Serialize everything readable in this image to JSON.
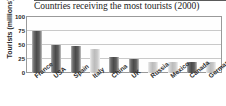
{
  "chart_data": {
    "type": "bar",
    "title": "Countries receiving the most tourists (2000)",
    "xlabel": "",
    "ylabel": "Tourists (millions)",
    "ylim": [
      0,
      100
    ],
    "yticks": [
      0,
      25,
      50,
      75,
      100
    ],
    "grid": true,
    "legend": "none",
    "categories": [
      "France",
      "USA",
      "Spain",
      "Italy",
      "China",
      "UK",
      "Russia",
      "Mexico",
      "Canada",
      "Germany"
    ],
    "values": [
      75,
      50,
      49,
      43,
      28,
      25,
      20,
      20,
      20,
      19
    ],
    "bar_shades": [
      "dark",
      "dark",
      "dark",
      "light",
      "dark",
      "dark",
      "light",
      "light",
      "dark",
      "light"
    ],
    "colors": {
      "bar_dark": "#4b4b4b",
      "bar_light": "#bcbcbc",
      "gridline": "#c9c9c9",
      "frame": "#9a9a9a",
      "text": "#2a2a2a",
      "background": "#ffffff"
    }
  },
  "chart": {
    "title": "Countries receiving the most tourists (2000)",
    "y_axis_title": "Tourists (millions)",
    "y_ticks": [
      "100",
      "75",
      "50",
      "25",
      "0"
    ],
    "x_labels": [
      "France",
      "USA",
      "Spain",
      "Italy",
      "China",
      "UK",
      "Russia",
      "Mexico",
      "Canada",
      "Germany"
    ]
  }
}
